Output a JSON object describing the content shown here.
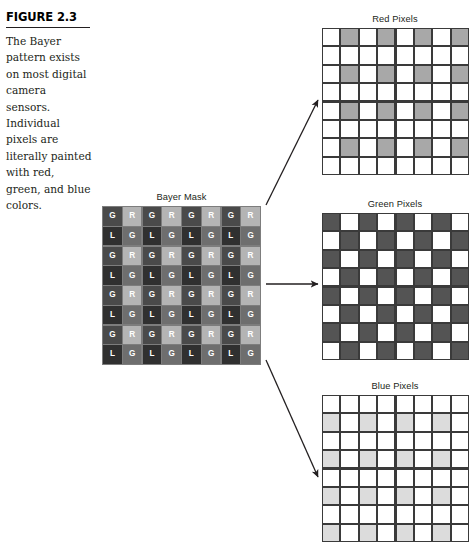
{
  "figure": {
    "label": "FIGURE 2.3",
    "caption": "The Bayer pattern exists on most digital camera sensors. Individual pixels are literally painted with red, green, and blue colors."
  },
  "panels": {
    "bayer": {
      "title": "Bayer Mask",
      "rows": [
        [
          "G",
          "R",
          "G",
          "R",
          "G",
          "R",
          "G",
          "R"
        ],
        [
          "L",
          "G",
          "L",
          "G",
          "L",
          "G",
          "L",
          "G"
        ],
        [
          "G",
          "R",
          "G",
          "R",
          "G",
          "R",
          "G",
          "R"
        ],
        [
          "L",
          "G",
          "L",
          "G",
          "L",
          "G",
          "L",
          "G"
        ],
        [
          "G",
          "R",
          "G",
          "R",
          "G",
          "R",
          "G",
          "R"
        ],
        [
          "L",
          "G",
          "L",
          "G",
          "L",
          "G",
          "L",
          "G"
        ],
        [
          "G",
          "R",
          "G",
          "R",
          "G",
          "R",
          "G",
          "R"
        ],
        [
          "L",
          "G",
          "L",
          "G",
          "L",
          "G",
          "L",
          "G"
        ]
      ]
    },
    "red": {
      "title": "Red Pixels",
      "rows": [
        [
          0,
          1,
          0,
          1,
          0,
          1,
          0,
          1
        ],
        [
          0,
          0,
          0,
          0,
          0,
          0,
          0,
          0
        ],
        [
          0,
          1,
          0,
          1,
          0,
          1,
          0,
          1
        ],
        [
          0,
          0,
          0,
          0,
          0,
          0,
          0,
          0
        ],
        [
          0,
          1,
          0,
          1,
          0,
          1,
          0,
          1
        ],
        [
          0,
          0,
          0,
          0,
          0,
          0,
          0,
          0
        ],
        [
          0,
          1,
          0,
          1,
          0,
          1,
          0,
          1
        ],
        [
          0,
          0,
          0,
          0,
          0,
          0,
          0,
          0
        ]
      ]
    },
    "green": {
      "title": "Green Pixels",
      "rows": [
        [
          1,
          0,
          1,
          0,
          1,
          0,
          1,
          0
        ],
        [
          0,
          1,
          0,
          1,
          0,
          1,
          0,
          1
        ],
        [
          1,
          0,
          1,
          0,
          1,
          0,
          1,
          0
        ],
        [
          0,
          1,
          0,
          1,
          0,
          1,
          0,
          1
        ],
        [
          1,
          0,
          1,
          0,
          1,
          0,
          1,
          0
        ],
        [
          0,
          1,
          0,
          1,
          0,
          1,
          0,
          1
        ],
        [
          1,
          0,
          1,
          0,
          1,
          0,
          1,
          0
        ],
        [
          0,
          1,
          0,
          1,
          0,
          1,
          0,
          1
        ]
      ]
    },
    "blue": {
      "title": "Blue Pixels",
      "rows": [
        [
          0,
          0,
          0,
          0,
          0,
          0,
          0,
          0
        ],
        [
          1,
          0,
          1,
          0,
          1,
          0,
          1,
          0
        ],
        [
          0,
          0,
          0,
          0,
          0,
          0,
          0,
          0
        ],
        [
          1,
          0,
          1,
          0,
          1,
          0,
          1,
          0
        ],
        [
          0,
          0,
          0,
          0,
          0,
          0,
          0,
          0
        ],
        [
          1,
          0,
          1,
          0,
          1,
          0,
          1,
          0
        ],
        [
          0,
          0,
          0,
          0,
          0,
          0,
          0,
          0
        ],
        [
          1,
          0,
          1,
          0,
          1,
          0,
          1,
          0
        ]
      ]
    }
  },
  "colors": {
    "rule": "#231f20",
    "grid_line": "#3a3a3a",
    "red_fill": "#a8a8a8",
    "green_fill": "#545454",
    "blue_fill": "#dcdcdc",
    "bayer_g_dark": "#4a4a4a",
    "bayer_r_light": "#b4b4b4",
    "bayer_b_dark": "#303030",
    "bayer_g_mid": "#6e6e6e"
  }
}
